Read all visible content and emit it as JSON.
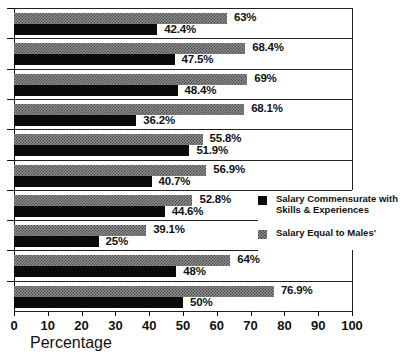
{
  "chart_data": {
    "type": "bar",
    "orientation": "horizontal",
    "title": "",
    "xlabel": "Percentage",
    "ylabel": "",
    "xlim": [
      0,
      100
    ],
    "xticks": [
      0,
      10,
      20,
      30,
      40,
      50,
      60,
      70,
      80,
      90,
      100
    ],
    "xticklabels": [
      "0",
      "10",
      "20",
      "30",
      "40",
      "50",
      "60",
      "70",
      "80",
      "90",
      "100"
    ],
    "grid": false,
    "legend_position": "center-right",
    "categories": [
      "1",
      "2",
      "3",
      "4",
      "5",
      "6",
      "7",
      "8",
      "9",
      "10"
    ],
    "series": [
      {
        "name": "Salary Equal to Males'",
        "style": "grey-checkered",
        "color": "#8e8e8e",
        "values": [
          63,
          68.4,
          69,
          68.1,
          55.8,
          56.9,
          52.8,
          39.1,
          64,
          76.9
        ],
        "labels": [
          "63%",
          "68.4%",
          "69%",
          "68.1%",
          "55.8%",
          "56.9%",
          "52.8%",
          "39.1%",
          "64%",
          "76.9%"
        ]
      },
      {
        "name": "Salary Commensurate with Skills & Experiences",
        "style": "solid-black",
        "color": "#0a0a0a",
        "values": [
          42.4,
          47.5,
          48.4,
          36.2,
          51.9,
          40.7,
          44.6,
          25,
          48,
          50
        ],
        "labels": [
          "42.4%",
          "47.5%",
          "48.4%",
          "36.2%",
          "51.9%",
          "40.7%",
          "44.6%",
          "25%",
          "48%",
          "50%"
        ]
      }
    ]
  },
  "legend": {
    "entries": [
      {
        "swatch": "black",
        "line1": "Salary Commensurate with",
        "line2": "Skills & Experiences"
      },
      {
        "swatch": "grey",
        "line1": "Salary Equal to Males'",
        "line2": ""
      }
    ]
  },
  "axis": {
    "x_title": "Percentage"
  }
}
